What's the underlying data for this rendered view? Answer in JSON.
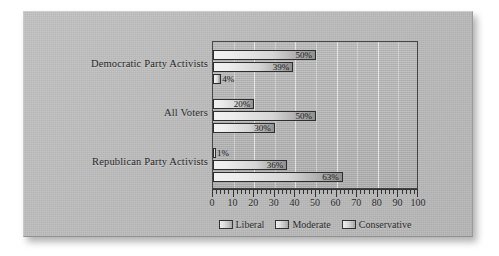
{
  "chart_data": {
    "type": "bar",
    "orientation": "horizontal",
    "title": "",
    "subtitle": "",
    "xlabel": "",
    "ylabel": "",
    "xlim": [
      0,
      100
    ],
    "xticks": [
      0,
      10,
      20,
      30,
      40,
      50,
      60,
      70,
      80,
      90,
      100
    ],
    "xticklabels": [
      "0",
      "10",
      "20",
      "30",
      "40",
      "50",
      "60",
      "70",
      "80",
      "90",
      "100"
    ],
    "minor_tick_step": 2,
    "grid": true,
    "grid_axis": "x",
    "legend_position": "bottom-center",
    "categories": [
      "Democratic Party Activists",
      "All Voters",
      "Republican Party Activists"
    ],
    "series": [
      {
        "name": "Liberal",
        "values": [
          50,
          20,
          1
        ],
        "labels": [
          "50%",
          "20%",
          "1%"
        ]
      },
      {
        "name": "Moderate",
        "values": [
          39,
          50,
          36
        ],
        "labels": [
          "39%",
          "50%",
          "36%"
        ]
      },
      {
        "name": "Conservative",
        "values": [
          4,
          30,
          63
        ],
        "labels": [
          "4%",
          "30%",
          "63%"
        ]
      }
    ],
    "bar_fill": "light-to-dark-gray-gradient",
    "bar_edge_color": "#2e2e2e",
    "plot_background": "#b8b8b8",
    "gridline_color": "#ffffff",
    "axis_color": "#2b2b2b",
    "text_color": "#1b1b1b",
    "panel_background": "#bcbcbc"
  },
  "legend": {
    "items": [
      {
        "label": "Liberal"
      },
      {
        "label": "Moderate"
      },
      {
        "label": "Conservative"
      }
    ]
  }
}
